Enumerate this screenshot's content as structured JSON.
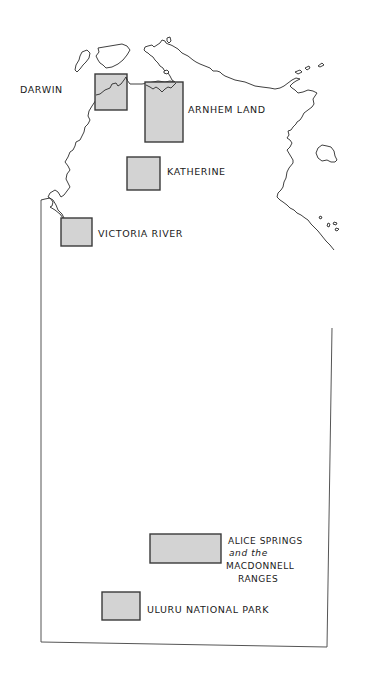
{
  "map": {
    "title": "Northern Territory regions",
    "colors": {
      "region_fill": "#d3d3d3",
      "outline": "#2a2a2a",
      "background": "#ffffff"
    },
    "regions": [
      {
        "id": "darwin",
        "label": "DARWIN"
      },
      {
        "id": "arnhem-land",
        "label": "ARNHEM LAND"
      },
      {
        "id": "katherine",
        "label": "KATHERINE"
      },
      {
        "id": "victoria-river",
        "label": "VICTORIA RIVER"
      },
      {
        "id": "alice-springs",
        "label_lines": [
          "ALICE SPRINGS",
          "and the",
          "MACDONNELL",
          "RANGES"
        ]
      },
      {
        "id": "uluru",
        "label": "ULURU NATIONAL PARK"
      }
    ]
  }
}
